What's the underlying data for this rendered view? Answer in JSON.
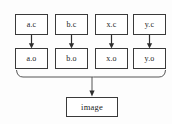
{
  "diagram": {
    "colors": {
      "background": "#fdfdfd",
      "box_fill": "#ffffff",
      "box_border": "#3a3a3a",
      "arrow": "#2e2e2e",
      "bracket": "#555555",
      "text": "#1c1c1c"
    },
    "sources": [
      {
        "label": "a.c"
      },
      {
        "label": "b.c"
      },
      {
        "label": "x.c"
      },
      {
        "label": "y.c"
      }
    ],
    "objects": [
      {
        "label": "a.o"
      },
      {
        "label": "b.o"
      },
      {
        "label": "x.o"
      },
      {
        "label": "y.o"
      }
    ],
    "target": {
      "label": "image"
    },
    "edges": [
      {
        "from": "a.c",
        "to": "a.o",
        "style": "arrow-down"
      },
      {
        "from": "b.c",
        "to": "b.o",
        "style": "arrow-down"
      },
      {
        "from": "x.c",
        "to": "x.o",
        "style": "arrow-down"
      },
      {
        "from": "y.c",
        "to": "y.o",
        "style": "arrow-down"
      },
      {
        "from": "a.o,b.o,x.o,y.o",
        "to": "image",
        "style": "bracket-join-arrow"
      }
    ]
  }
}
